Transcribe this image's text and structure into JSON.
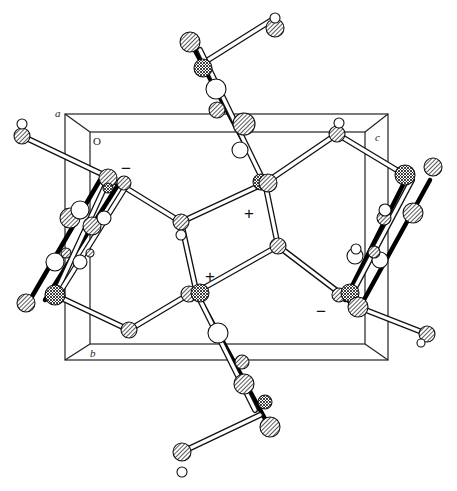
{
  "figure": {
    "type": "crystal-packing-diagram",
    "axis_labels": {
      "a": "a",
      "b": "b",
      "c": "c",
      "origin": "O"
    },
    "charges": [
      {
        "symbol": "−",
        "x": 127,
        "y": 168
      },
      {
        "symbol": "+",
        "x": 250,
        "y": 213
      },
      {
        "symbol": "+",
        "x": 211,
        "y": 276
      },
      {
        "symbol": "−",
        "x": 322,
        "y": 311
      }
    ],
    "colors": {
      "line": "#111111",
      "background": "#ffffff"
    }
  }
}
